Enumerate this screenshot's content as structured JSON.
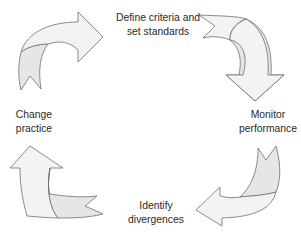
{
  "diagram": {
    "type": "cycle",
    "stages": [
      {
        "id": "define",
        "lines": [
          "Define criteria and",
          "set standards"
        ]
      },
      {
        "id": "monitor",
        "lines": [
          "Monitor",
          "performance"
        ]
      },
      {
        "id": "identify",
        "lines": [
          "Identify",
          "divergences"
        ]
      },
      {
        "id": "change",
        "lines": [
          "Change",
          "practice"
        ]
      }
    ],
    "arrows": [
      {
        "from": "change",
        "to": "define",
        "direction": "clockwise",
        "icon": "curved-arrow-right-icon"
      },
      {
        "from": "define",
        "to": "monitor",
        "direction": "clockwise",
        "icon": "curved-arrow-down-icon"
      },
      {
        "from": "monitor",
        "to": "identify",
        "direction": "clockwise",
        "icon": "curved-arrow-left-icon"
      },
      {
        "from": "identify",
        "to": "change",
        "direction": "clockwise",
        "icon": "curved-arrow-up-icon"
      }
    ],
    "colors": {
      "arrow_fill": "#f3f3f3",
      "arrow_shade": "#e6e6e6",
      "arrow_stroke": "#6e6e6e",
      "text": "#2a2a2a",
      "background": "#ffffff"
    }
  }
}
